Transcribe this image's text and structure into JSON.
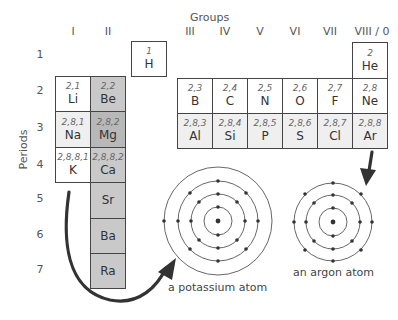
{
  "headers": {
    "groups_title": "Groups",
    "periods_title": "Periods",
    "groups": [
      "I",
      "II",
      "III",
      "IV",
      "V",
      "VI",
      "VII",
      "VIII / 0"
    ],
    "periods": [
      "1",
      "2",
      "3",
      "4",
      "5",
      "6",
      "7"
    ]
  },
  "elements": {
    "H": {
      "config": "1",
      "symbol": "H"
    },
    "He": {
      "config": "2",
      "symbol": "He"
    },
    "Li": {
      "config": "2,1",
      "symbol": "Li"
    },
    "Be": {
      "config": "2,2",
      "symbol": "Be"
    },
    "Na": {
      "config": "2,8,1",
      "symbol": "Na"
    },
    "Mg": {
      "config": "2,8,2",
      "symbol": "Mg"
    },
    "K": {
      "config": "2,8,8,1",
      "symbol": "K"
    },
    "Ca": {
      "config": "2,8,8,2",
      "symbol": "Ca"
    },
    "Sr": {
      "symbol": "Sr"
    },
    "Ba": {
      "symbol": "Ba"
    },
    "Ra": {
      "symbol": "Ra"
    },
    "B": {
      "config": "2,3",
      "symbol": "B"
    },
    "C": {
      "config": "2,4",
      "symbol": "C"
    },
    "N": {
      "config": "2,5",
      "symbol": "N"
    },
    "O": {
      "config": "2,6",
      "symbol": "O"
    },
    "F": {
      "config": "2,7",
      "symbol": "F"
    },
    "Ne": {
      "config": "2,8",
      "symbol": "Ne"
    },
    "Al": {
      "config": "2,8,3",
      "symbol": "Al"
    },
    "Si": {
      "config": "2,8,4",
      "symbol": "Si"
    },
    "P": {
      "config": "2,8,5",
      "symbol": "P"
    },
    "S": {
      "config": "2,8,6",
      "symbol": "S"
    },
    "Cl": {
      "config": "2,8,7",
      "symbol": "Cl"
    },
    "Ar": {
      "config": "2,8,8",
      "symbol": "Ar"
    }
  },
  "atoms": {
    "potassium": {
      "caption": "a potassium atom",
      "shells": [
        2,
        8,
        8,
        1
      ]
    },
    "argon": {
      "caption": "an argon atom",
      "shells": [
        2,
        8,
        8
      ]
    }
  },
  "colors": {
    "group2_fill": "#c9c9c9",
    "period3_fill": "#efefef",
    "line": "#444444",
    "arrow": "#333333"
  }
}
